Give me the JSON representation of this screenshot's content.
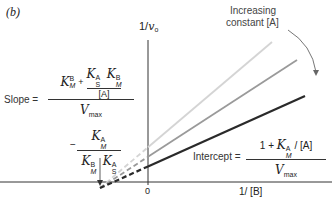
{
  "panel_label": "(b)",
  "y_axis_label": {
    "prefix": "1/",
    "var": "v",
    "sub": "o"
  },
  "x_axis_label": "1/ [B]",
  "origin_label": "0",
  "annotation": {
    "line1": "Increasing",
    "line2": "constant [A]"
  },
  "slope_formula": {
    "lhs": "Slope =",
    "term1_K": "K",
    "term1_sup": "B",
    "term1_sub": "M",
    "plus": "+",
    "inner_num_K1": "K",
    "inner_num_K1_sup": "A",
    "inner_num_K1_sub": "S",
    "inner_num_K2": "K",
    "inner_num_K2_sup": "B",
    "inner_num_K2_sub": "M",
    "inner_den": "[A]",
    "den_V": "V",
    "den_sub": "max"
  },
  "xint_formula": {
    "sign": "−",
    "num_K": "K",
    "num_sup": "A",
    "num_sub": "M",
    "den_K1": "K",
    "den_K1_sup": "B",
    "den_K1_sub": "M",
    "den_K2": "K",
    "den_K2_sup": "A",
    "den_K2_sub": "S"
  },
  "intercept_formula": {
    "lhs": "Intercept =",
    "num_pre": "1 + ",
    "num_K": "K",
    "num_sup": "A",
    "num_sub": "M",
    "num_post": " / [A]",
    "den_V": "V",
    "den_sub": "max"
  },
  "lines": [
    {
      "name": "low-A",
      "color": "#d4d4d4"
    },
    {
      "name": "mid-A",
      "color": "#9a9a9a"
    },
    {
      "name": "high-A",
      "color": "#2a2a2a"
    }
  ],
  "axis_color": "#333333"
}
